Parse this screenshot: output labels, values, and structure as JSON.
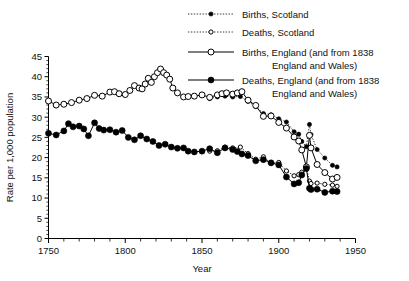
{
  "chart_data": {
    "type": "line",
    "title": "",
    "xlabel": "Year",
    "ylabel": "Rate per 1,000 population",
    "xlim": [
      1750,
      1950
    ],
    "ylim": [
      0,
      45
    ],
    "xticks": [
      1750,
      1800,
      1850,
      1900,
      1950
    ],
    "xtick_labels": [
      "1750",
      "1800",
      "1850",
      "1900",
      "1950"
    ],
    "xminor_step": 10,
    "yticks": [
      0,
      5,
      10,
      15,
      20,
      25,
      30,
      35,
      40,
      45
    ],
    "ytick_labels": [
      "0",
      "5",
      "10",
      "15",
      "20",
      "25",
      "30",
      "35",
      "40",
      "45"
    ],
    "grid": false,
    "legend_position": "top-center",
    "series": [
      {
        "name": "Births, Scotland",
        "label": "Births, Scotland",
        "label_line2": "",
        "linestyle": "dotted",
        "marker": "filled-circle",
        "marker_size": 2.1,
        "color": "#000000",
        "points": [
          [
            1855,
            34.6
          ],
          [
            1860,
            35.0
          ],
          [
            1865,
            35.2
          ],
          [
            1870,
            35.0
          ],
          [
            1875,
            35.1
          ],
          [
            1880,
            33.9
          ],
          [
            1885,
            32.6
          ],
          [
            1890,
            30.9
          ],
          [
            1895,
            30.6
          ],
          [
            1900,
            29.6
          ],
          [
            1905,
            28.8
          ],
          [
            1910,
            26.4
          ],
          [
            1913,
            25.8
          ],
          [
            1915,
            24.0
          ],
          [
            1918,
            22.7
          ],
          [
            1920,
            28.2
          ],
          [
            1921,
            25.7
          ],
          [
            1925,
            22.0
          ],
          [
            1930,
            19.9
          ],
          [
            1935,
            18.1
          ],
          [
            1938,
            17.7
          ]
        ]
      },
      {
        "name": "Deaths, Scotland",
        "label": "Deaths, Scotland",
        "label_line2": "",
        "linestyle": "dotted",
        "marker": "open-circle",
        "marker_size": 2.1,
        "color": "#000000",
        "points": [
          [
            1855,
            21.6
          ],
          [
            1860,
            21.7
          ],
          [
            1865,
            22.6
          ],
          [
            1870,
            22.4
          ],
          [
            1875,
            22.6
          ],
          [
            1880,
            21.0
          ],
          [
            1885,
            19.6
          ],
          [
            1890,
            20.2
          ],
          [
            1895,
            18.6
          ],
          [
            1900,
            18.8
          ],
          [
            1905,
            16.7
          ],
          [
            1910,
            15.5
          ],
          [
            1913,
            15.8
          ],
          [
            1915,
            16.4
          ],
          [
            1918,
            17.6
          ],
          [
            1920,
            14.2
          ],
          [
            1921,
            13.6
          ],
          [
            1925,
            13.7
          ],
          [
            1930,
            13.4
          ],
          [
            1935,
            13.2
          ],
          [
            1938,
            12.9
          ]
        ]
      },
      {
        "name": "Births, England",
        "label": "Births, England (and from 1838",
        "label_line2": "England and Wales)",
        "linestyle": "solid",
        "marker": "open-circle",
        "marker_size": 3.0,
        "color": "#000000",
        "points": [
          [
            1750,
            34.0
          ],
          [
            1755,
            33.0
          ],
          [
            1760,
            33.2
          ],
          [
            1765,
            33.6
          ],
          [
            1770,
            34.2
          ],
          [
            1775,
            34.6
          ],
          [
            1780,
            35.4
          ],
          [
            1785,
            35.2
          ],
          [
            1790,
            36.2
          ],
          [
            1793,
            36.3
          ],
          [
            1796,
            35.8
          ],
          [
            1800,
            35.6
          ],
          [
            1803,
            36.6
          ],
          [
            1806,
            37.8
          ],
          [
            1809,
            37.2
          ],
          [
            1811,
            37.0
          ],
          [
            1813,
            38.2
          ],
          [
            1815,
            39.6
          ],
          [
            1817,
            38.6
          ],
          [
            1819,
            40.0
          ],
          [
            1821,
            41.0
          ],
          [
            1823,
            41.9
          ],
          [
            1825,
            41.0
          ],
          [
            1827,
            40.4
          ],
          [
            1829,
            39.4
          ],
          [
            1831,
            37.2
          ],
          [
            1834,
            36.0
          ],
          [
            1838,
            35.0
          ],
          [
            1841,
            35.1
          ],
          [
            1845,
            35.2
          ],
          [
            1850,
            35.5
          ],
          [
            1855,
            34.9
          ],
          [
            1860,
            35.5
          ],
          [
            1863,
            35.8
          ],
          [
            1866,
            36.0
          ],
          [
            1870,
            35.7
          ],
          [
            1873,
            36.0
          ],
          [
            1876,
            36.3
          ],
          [
            1880,
            34.2
          ],
          [
            1885,
            32.9
          ],
          [
            1890,
            30.2
          ],
          [
            1895,
            30.3
          ],
          [
            1900,
            28.7
          ],
          [
            1905,
            27.3
          ],
          [
            1910,
            25.1
          ],
          [
            1913,
            24.1
          ],
          [
            1915,
            21.9
          ],
          [
            1918,
            17.7
          ],
          [
            1920,
            25.5
          ],
          [
            1921,
            22.4
          ],
          [
            1925,
            18.3
          ],
          [
            1930,
            16.3
          ],
          [
            1935,
            14.7
          ],
          [
            1938,
            15.1
          ]
        ]
      },
      {
        "name": "Deaths, England",
        "label": "Deaths, England (and from 1838",
        "label_line2": "England and Wales)",
        "linestyle": "solid",
        "marker": "filled-circle",
        "marker_size": 3.0,
        "color": "#000000",
        "points": [
          [
            1750,
            26.0
          ],
          [
            1755,
            25.6
          ],
          [
            1760,
            26.6
          ],
          [
            1763,
            28.4
          ],
          [
            1766,
            27.6
          ],
          [
            1770,
            27.8
          ],
          [
            1773,
            27.1
          ],
          [
            1776,
            25.4
          ],
          [
            1780,
            28.6
          ],
          [
            1783,
            27.2
          ],
          [
            1786,
            26.8
          ],
          [
            1790,
            26.9
          ],
          [
            1794,
            26.3
          ],
          [
            1798,
            26.7
          ],
          [
            1802,
            25.0
          ],
          [
            1806,
            24.4
          ],
          [
            1810,
            25.4
          ],
          [
            1814,
            24.6
          ],
          [
            1818,
            24.0
          ],
          [
            1822,
            23.0
          ],
          [
            1826,
            23.3
          ],
          [
            1830,
            22.6
          ],
          [
            1834,
            22.3
          ],
          [
            1838,
            22.4
          ],
          [
            1841,
            21.6
          ],
          [
            1845,
            21.4
          ],
          [
            1850,
            21.6
          ],
          [
            1855,
            22.2
          ],
          [
            1860,
            21.2
          ],
          [
            1865,
            22.4
          ],
          [
            1870,
            22.0
          ],
          [
            1873,
            21.5
          ],
          [
            1876,
            20.9
          ],
          [
            1880,
            20.5
          ],
          [
            1885,
            19.2
          ],
          [
            1890,
            19.5
          ],
          [
            1895,
            18.7
          ],
          [
            1900,
            18.2
          ],
          [
            1905,
            15.2
          ],
          [
            1910,
            13.5
          ],
          [
            1913,
            13.8
          ],
          [
            1915,
            15.7
          ],
          [
            1918,
            17.3
          ],
          [
            1920,
            12.4
          ],
          [
            1921,
            12.1
          ],
          [
            1925,
            12.2
          ],
          [
            1930,
            11.4
          ],
          [
            1935,
            11.7
          ],
          [
            1938,
            11.6
          ]
        ]
      }
    ]
  },
  "legend": {
    "entries": [
      {
        "label": "Births, Scotland",
        "label2": ""
      },
      {
        "label": "Deaths, Scotland",
        "label2": ""
      },
      {
        "label": "Births, England (and from 1838",
        "label2": "England and Wales)"
      },
      {
        "label": "Deaths, England (and from 1838",
        "label2": "England and Wales)"
      }
    ]
  }
}
